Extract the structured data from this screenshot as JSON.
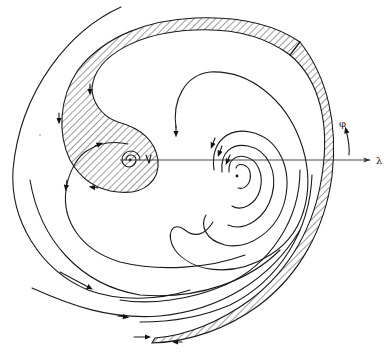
{
  "diagram": {
    "type": "phase-portrait / streamline diagram",
    "axes": {
      "horizontal_label": "λ",
      "vertical_label": "φ"
    },
    "critical_points": [
      {
        "name": "left-focus",
        "kind": "spiral (inside hatched region)",
        "x": 130,
        "y": 160
      },
      {
        "name": "right-focus",
        "kind": "spiral sink",
        "x": 237,
        "y": 173
      }
    ],
    "regions": [
      {
        "name": "hatched-s-region",
        "description": "Hatched S-shaped band from top arc wrapping down around left focus"
      },
      {
        "name": "hatched-outer-boundary",
        "description": "Thin hatched outer boundary on the right side curving down to bottom"
      }
    ],
    "colors": {
      "line": "#1a1a1a",
      "background": "#ffffff"
    }
  }
}
